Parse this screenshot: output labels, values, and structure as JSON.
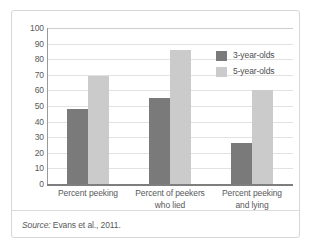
{
  "chart_data": {
    "type": "bar",
    "title": "",
    "subtitle": "",
    "xlabel": "",
    "ylabel": "",
    "ylim": [
      0,
      100
    ],
    "yticks": [
      0,
      10,
      20,
      30,
      40,
      50,
      60,
      70,
      80,
      90,
      100
    ],
    "ytick_labels": [
      "0",
      "10",
      "20",
      "30",
      "40",
      "50",
      "60",
      "70",
      "80",
      "90",
      "100"
    ],
    "grid": true,
    "legend_position": "top-right",
    "categories": [
      "Percent peeking",
      "Percent of peekers who lied",
      "Percent peeking and lying"
    ],
    "category_lines": [
      [
        "Percent peeking"
      ],
      [
        "Percent of peekers",
        "who lied"
      ],
      [
        "Percent peeking",
        "and lying"
      ]
    ],
    "series": [
      {
        "name": "3-year-olds",
        "color": "#7a7a7a",
        "values": [
          48,
          55,
          26
        ]
      },
      {
        "name": "5-year-olds",
        "color": "#cbcbcb",
        "values": [
          69,
          86,
          60
        ]
      }
    ]
  },
  "legend": {
    "items": [
      {
        "label": "3-year-olds",
        "color": "#7a7a7a"
      },
      {
        "label": "5-year-olds",
        "color": "#cbcbcb"
      }
    ]
  },
  "source": {
    "prefix": "Source:",
    "text": "Evans et al., 2011."
  },
  "colors": {
    "series_3yo": "#7a7a7a",
    "series_5yo": "#cbcbcb",
    "gridline": "#e2e2e2",
    "axis": "#7e7e7e",
    "text": "#58595b",
    "frame": "#d6d6d6"
  }
}
